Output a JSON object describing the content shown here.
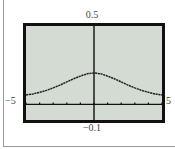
{
  "chart_data": {
    "type": "line",
    "title": "",
    "xlabel": "",
    "ylabel": "",
    "xlim": [
      -5,
      5
    ],
    "ylim": [
      -0.1,
      0.5
    ],
    "x_tick_labels": {
      "min": "−5",
      "max": "5"
    },
    "y_tick_labels": {
      "min": "−0.1",
      "max": "0.5"
    },
    "x_ticks": [
      -5,
      -4,
      -3,
      -2,
      -1,
      0,
      1,
      2,
      3,
      4,
      5
    ],
    "grid": false,
    "legend": null,
    "series": [
      {
        "name": "f(x)",
        "x": [
          -5,
          -4.5,
          -4,
          -3.5,
          -3,
          -2.5,
          -2,
          -1.5,
          -1,
          -0.5,
          0,
          0.5,
          1,
          1.5,
          2,
          2.5,
          3,
          3.5,
          4,
          4.5,
          5
        ],
        "values": [
          0.06,
          0.066,
          0.077,
          0.089,
          0.105,
          0.123,
          0.143,
          0.163,
          0.18,
          0.195,
          0.2,
          0.195,
          0.18,
          0.163,
          0.143,
          0.123,
          0.105,
          0.089,
          0.077,
          0.066,
          0.06
        ]
      }
    ]
  },
  "labels": {
    "ymax": "0.5",
    "ymin": "−0.1",
    "xmin": "−5",
    "xmax": "5"
  },
  "colors": {
    "plot_background": "#d3dbd3",
    "frame": "#111111",
    "curve": "#222222",
    "axes": "#111111"
  }
}
